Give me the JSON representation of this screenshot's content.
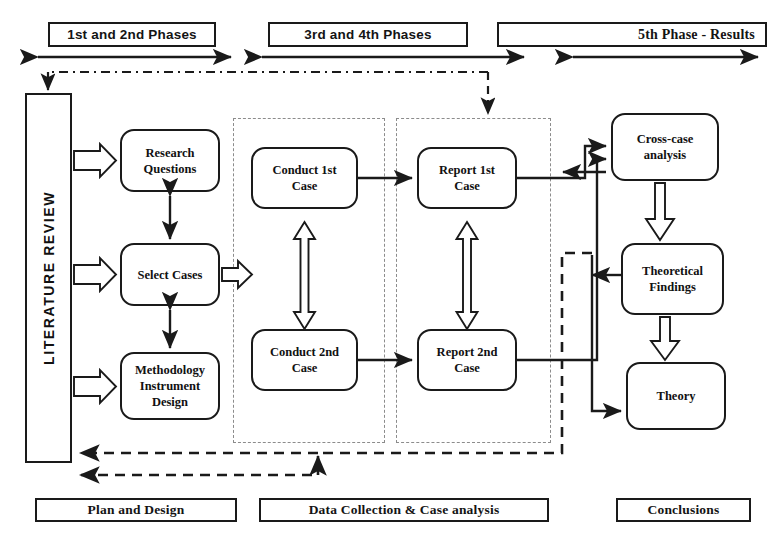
{
  "diagram": {
    "phase_headers": [
      {
        "id": "phase-1-2",
        "label": "1st and 2nd Phases"
      },
      {
        "id": "phase-3-4",
        "label": "3rd and 4th Phases"
      },
      {
        "id": "phase-5",
        "label": "5th  Phase - Results"
      }
    ],
    "stage_footers": [
      {
        "id": "plan-and-design",
        "label": "Plan and Design"
      },
      {
        "id": "data-collection",
        "label": "Data Collection & Case analysis"
      },
      {
        "id": "conclusions",
        "label": "Conclusions"
      }
    ],
    "literature_review": {
      "id": "literature-review",
      "label": "LITERATURE REVIEW"
    },
    "nodes": [
      {
        "id": "research-questions",
        "label": "Research\nQuestions"
      },
      {
        "id": "select-cases",
        "label": "Select Cases"
      },
      {
        "id": "methodology-instrument-design",
        "label": "Methodology\nInstrument\nDesign"
      },
      {
        "id": "conduct-1st-case",
        "label": "Conduct 1st\nCase"
      },
      {
        "id": "conduct-2nd-case",
        "label": "Conduct 2nd\nCase"
      },
      {
        "id": "report-1st-case",
        "label": "Report 1st\nCase"
      },
      {
        "id": "report-2nd-case",
        "label": "Report 2nd\nCase"
      },
      {
        "id": "cross-case-analysis",
        "label": "Cross-case\nanalysis"
      },
      {
        "id": "theoretical-findings",
        "label": "Theoretical\nFindings"
      },
      {
        "id": "theory",
        "label": "Theory"
      }
    ],
    "colors": {
      "stroke": "#1a1a1a",
      "dotted": "#8c8c8c",
      "dashed": "#1a1a1a",
      "background": "#ffffff",
      "text": "#111111"
    }
  }
}
